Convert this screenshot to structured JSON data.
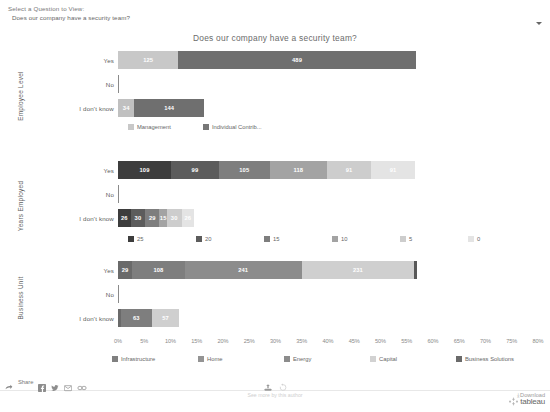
{
  "filter": {
    "label": "Select a Question to View:",
    "value": "Does our company have a security team?",
    "caret": "chevron-down-icon"
  },
  "title": "Does our company have a security team?",
  "axis": {
    "tick_labels": [
      "0%",
      "5%",
      "10%",
      "15%",
      "20%",
      "25%",
      "30%",
      "35%",
      "40%",
      "45%",
      "50%",
      "55%",
      "60%",
      "65%",
      "70%",
      "75%",
      "80%"
    ],
    "max_percent": 80
  },
  "row_labels": [
    "Yes",
    "No",
    "I don't know"
  ],
  "panels": [
    {
      "name": "Employee Level",
      "legend": [
        {
          "label": "Management",
          "color": "#c8c8c8"
        },
        {
          "label": "Individual Contrib...",
          "color": "#777777"
        }
      ],
      "rows": [
        {
          "label": "Yes",
          "segments": [
            {
              "series": "Management",
              "value": 125,
              "color": "#c8c8c8",
              "percent": 11.5
            },
            {
              "series": "Individual Contrib...",
              "value": 489,
              "color": "#6f6f6f",
              "percent": 45.2
            }
          ]
        },
        {
          "label": "No",
          "segments": [
            {
              "series": "Individual Contrib...",
              "value": null,
              "color": "#8a8a8a",
              "percent": 0.35
            }
          ]
        },
        {
          "label": "I don't know",
          "segments": [
            {
              "series": "Management",
              "value": 34,
              "color": "#c0c0c0",
              "percent": 3.1
            },
            {
              "series": "Individual Contrib...",
              "value": 144,
              "color": "#6f6f6f",
              "percent": 13.3
            }
          ]
        }
      ]
    },
    {
      "name": "Years Employed",
      "legend": [
        {
          "label": "25",
          "color": "#3d3d3d"
        },
        {
          "label": "20",
          "color": "#5c5c5c"
        },
        {
          "label": "15",
          "color": "#7e7e7e"
        },
        {
          "label": "10",
          "color": "#a3a3a3"
        },
        {
          "label": "5",
          "color": "#cdcdcd"
        },
        {
          "label": "0",
          "color": "#e4e4e4"
        }
      ],
      "rows": [
        {
          "label": "Yes",
          "segments": [
            {
              "series": "25",
              "value": 109,
              "color": "#3d3d3d",
              "percent": 10.1
            },
            {
              "series": "20",
              "value": 99,
              "color": "#5c5c5c",
              "percent": 9.1
            },
            {
              "series": "15",
              "value": 105,
              "color": "#7e7e7e",
              "percent": 9.7
            },
            {
              "series": "10",
              "value": 118,
              "color": "#a3a3a3",
              "percent": 10.9
            },
            {
              "series": "5",
              "value": 91,
              "color": "#cdcdcd",
              "percent": 8.4
            },
            {
              "series": "0",
              "value": 91,
              "color": "#e4e4e4",
              "percent": 8.4
            }
          ]
        },
        {
          "label": "No",
          "segments": [
            {
              "series": "25",
              "value": null,
              "color": "#8a8a8a",
              "percent": 0.35
            }
          ]
        },
        {
          "label": "I don't know",
          "segments": [
            {
              "series": "25",
              "value": 26,
              "color": "#3d3d3d",
              "percent": 2.4
            },
            {
              "series": "20",
              "value": 30,
              "color": "#5c5c5c",
              "percent": 2.8
            },
            {
              "series": "15",
              "value": 29,
              "color": "#7e7e7e",
              "percent": 2.7
            },
            {
              "series": "10",
              "value": 15,
              "color": "#a3a3a3",
              "percent": 1.4
            },
            {
              "series": "5",
              "value": 30,
              "color": "#cdcdcd",
              "percent": 2.8
            },
            {
              "series": "0",
              "value": 26,
              "color": "#e4e4e4",
              "percent": 2.4
            }
          ]
        }
      ]
    },
    {
      "name": "Business Unit",
      "legend": [
        {
          "label": "Infrastructure",
          "color": "#808080"
        },
        {
          "label": "Home",
          "color": "#949494"
        },
        {
          "label": "Energy",
          "color": "#8c8c8c"
        },
        {
          "label": "Capital",
          "color": "#d2d2d2"
        },
        {
          "label": "Business Solutions",
          "color": "#6a6a6a"
        }
      ],
      "rows": [
        {
          "label": "Yes",
          "segments": [
            {
              "series": "Infrastructure",
              "value": 29,
              "color": "#6a6a6a",
              "percent": 2.7
            },
            {
              "series": "Home",
              "value": 108,
              "color": "#7e7e7e",
              "percent": 10.0
            },
            {
              "series": "Energy",
              "value": 241,
              "color": "#8c8c8c",
              "percent": 22.3
            },
            {
              "series": "Capital",
              "value": 231,
              "color": "#cfcfcf",
              "percent": 21.4
            },
            {
              "series": "Business Solutions",
              "value": null,
              "color": "#585858",
              "percent": 0.5
            }
          ]
        },
        {
          "label": "No",
          "segments": [
            {
              "series": "Infrastructure",
              "value": null,
              "color": "#8a8a8a",
              "percent": 0.35
            }
          ]
        },
        {
          "label": "I don't know",
          "segments": [
            {
              "series": "Infrastructure",
              "value": null,
              "color": "#6a6a6a",
              "percent": 0.6
            },
            {
              "series": "Home",
              "value": 63,
              "color": "#7e7e7e",
              "percent": 5.8
            },
            {
              "series": "Energy",
              "value": 57,
              "color": "#cfcfcf",
              "percent": 5.3
            }
          ]
        }
      ]
    }
  ],
  "toolbar": {
    "share_label": "Share",
    "icons": [
      "share-arrow-icon",
      "facebook-icon",
      "twitter-icon",
      "email-icon",
      "link-icon"
    ],
    "upload_icon": "upload-icon",
    "revert_icon": "revert-icon",
    "see_more": "See more by this author",
    "download_label": "Download",
    "download_icon": "download-arrow-icon",
    "brand": "tableau"
  },
  "chart_data": {
    "type": "bar",
    "orientation": "horizontal",
    "stacked": true,
    "title": "Does our company have a security team?",
    "xlabel": "",
    "ylabel": "",
    "xlim": [
      0,
      80
    ],
    "x_unit": "percent",
    "grid": false,
    "legend_position": "bottom",
    "categories": [
      "Yes",
      "No",
      "I don't know"
    ],
    "panels": [
      {
        "panel": "Employee Level",
        "series": [
          {
            "name": "Management",
            "values": [
              125,
              0,
              34
            ]
          },
          {
            "name": "Individual Contrib...",
            "values": [
              489,
              4,
              144
            ]
          }
        ]
      },
      {
        "panel": "Years Employed",
        "series": [
          {
            "name": "25",
            "values": [
              109,
              0,
              26
            ]
          },
          {
            "name": "20",
            "values": [
              99,
              0,
              30
            ]
          },
          {
            "name": "15",
            "values": [
              105,
              0,
              29
            ]
          },
          {
            "name": "10",
            "values": [
              118,
              0,
              15
            ]
          },
          {
            "name": "5",
            "values": [
              91,
              0,
              30
            ]
          },
          {
            "name": "0",
            "values": [
              91,
              0,
              26
            ]
          }
        ]
      },
      {
        "panel": "Business Unit",
        "series": [
          {
            "name": "Infrastructure",
            "values": [
              29,
              4,
              6
            ]
          },
          {
            "name": "Home",
            "values": [
              108,
              0,
              63
            ]
          },
          {
            "name": "Energy",
            "values": [
              241,
              0,
              57
            ]
          },
          {
            "name": "Capital",
            "values": [
              231,
              0,
              0
            ]
          },
          {
            "name": "Business Solutions",
            "values": [
              5,
              0,
              0
            ]
          }
        ]
      }
    ]
  }
}
